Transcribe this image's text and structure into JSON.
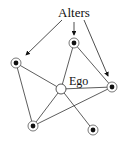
{
  "diagram": {
    "title_label": "Alters",
    "ego_label": "Ego",
    "colors": {
      "line": "#333333",
      "node_fill": "#111111",
      "ring": "#555555",
      "background": "#ffffff"
    },
    "nodes": [
      {
        "id": "left",
        "x": 16,
        "y": 63,
        "type": "alter"
      },
      {
        "id": "top",
        "x": 74,
        "y": 43,
        "type": "alter"
      },
      {
        "id": "right",
        "x": 112,
        "y": 87,
        "type": "alter"
      },
      {
        "id": "ego",
        "x": 61,
        "y": 89,
        "type": "ego"
      },
      {
        "id": "bottom-left",
        "x": 33,
        "y": 126,
        "type": "alter"
      },
      {
        "id": "bottom-right",
        "x": 93,
        "y": 130,
        "type": "alter"
      }
    ],
    "edges": [
      [
        "left",
        "ego"
      ],
      [
        "left",
        "bottom-left"
      ],
      [
        "top",
        "ego"
      ],
      [
        "top",
        "right"
      ],
      [
        "ego",
        "right"
      ],
      [
        "ego",
        "bottom-left"
      ],
      [
        "ego",
        "bottom-right"
      ],
      [
        "bottom-left",
        "right"
      ]
    ],
    "arrows": [
      {
        "from": [
          62,
          20
        ],
        "to": [
          26,
          55
        ],
        "target": "left"
      },
      {
        "from": [
          74,
          22
        ],
        "to": [
          74,
          35
        ],
        "target": "top"
      },
      {
        "from": [
          84,
          20
        ],
        "to": [
          108,
          76
        ],
        "target": "right"
      }
    ]
  }
}
